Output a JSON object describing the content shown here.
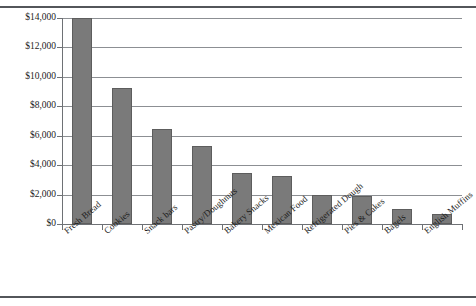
{
  "chart_data": {
    "type": "bar",
    "title": "",
    "subtitle": "",
    "xlabel": "",
    "ylabel": "",
    "categories": [
      "Fresh Bread",
      "Cookies",
      "Snack bars",
      "Pastry/Doughnuts",
      "Bakery Snacks",
      "Mexican Food",
      "Refrigerated Dough",
      "Pies & Cakes",
      "Bagels",
      "English Muffins"
    ],
    "values": [
      14000,
      9250,
      6450,
      5300,
      3500,
      3250,
      2000,
      1900,
      1000,
      700
    ],
    "ylim": [
      0,
      14000
    ],
    "ytick_values": [
      0,
      2000,
      4000,
      6000,
      8000,
      10000,
      12000,
      14000
    ],
    "ytick_labels": [
      "$0",
      "$2,000",
      "$4,000",
      "$6,000",
      "$8,000",
      "$10,000",
      "$12,000",
      "$14,000"
    ],
    "grid": true,
    "legend": false,
    "legend_position": "none",
    "bar_color": "#7a7a7a",
    "bar_edge_color": "#5d5d5d",
    "grid_color": "#8c8f93",
    "axis_color": "#6e7175",
    "background_color": "#ffffff",
    "rule_color": "#53565a",
    "label_rotation": -40
  }
}
